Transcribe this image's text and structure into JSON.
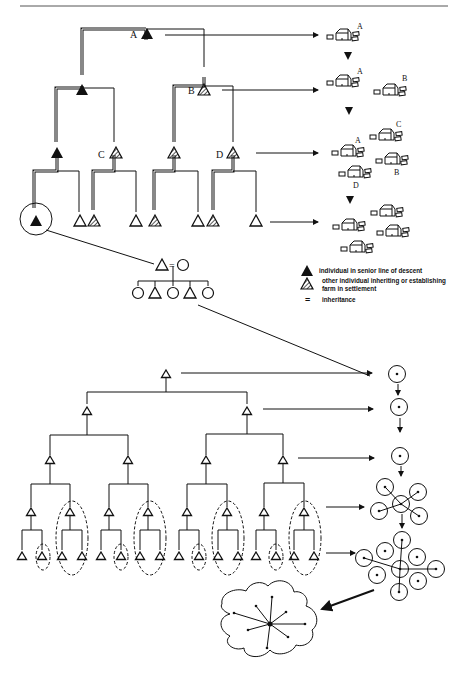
{
  "figure": {
    "top_tree": {
      "labels": {
        "a": "A",
        "b": "B",
        "c": "C",
        "d": "D"
      }
    },
    "settlement_stages": [
      {
        "labels": [
          "A"
        ]
      },
      {
        "labels": [
          "A",
          "B"
        ]
      },
      {
        "labels": [
          "A",
          "B",
          "C",
          "D"
        ]
      },
      {
        "labels": []
      }
    ],
    "kinship_detail": {
      "equals": "=",
      "children": [
        "circle",
        "triangle",
        "circle",
        "triangle",
        "circle"
      ]
    },
    "legend": {
      "items": [
        {
          "icon": "filled-triangle-icon",
          "text": "individual in senior line of descent"
        },
        {
          "icon": "hatched-triangle-icon",
          "text_line1": "other individual inheriting or establishing",
          "text_line2": "farm in settlement"
        },
        {
          "icon": "equals-sign",
          "symbol": "=",
          "text": "inheritance"
        }
      ]
    },
    "bottom_tree": {
      "levels": 4,
      "expansion_stages": [
        "1 settlement",
        "1 settlement",
        "1 settlement",
        "6 settlements",
        "9 settlements",
        "territory cluster"
      ]
    },
    "colors": {
      "ink": "#111111",
      "paper": "#ffffff"
    }
  }
}
